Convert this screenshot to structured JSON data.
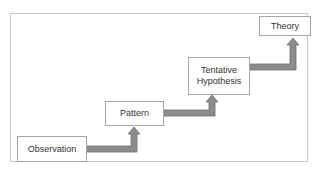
{
  "diagram": {
    "type": "staircase-flow",
    "colors": {
      "frame_border": "#c8c8c8",
      "box_border": "#a6a6a6",
      "arrow_fill": "#8c8c8c",
      "arrow_stroke": "#6e6e6e",
      "text": "#333333"
    },
    "steps": [
      {
        "id": "observation",
        "label": "Observation"
      },
      {
        "id": "pattern",
        "label": "Pattern"
      },
      {
        "id": "tentative-hypothesis",
        "label": "Tentative\nHypothesis"
      },
      {
        "id": "theory",
        "label": "Theory"
      }
    ],
    "connections": [
      {
        "from": "observation",
        "to": "pattern"
      },
      {
        "from": "pattern",
        "to": "tentative-hypothesis"
      },
      {
        "from": "tentative-hypothesis",
        "to": "theory"
      }
    ]
  }
}
